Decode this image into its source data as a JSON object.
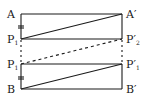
{
  "diagram": {
    "type": "geometry-rectangle-strips",
    "points": {
      "A": {
        "label": "A",
        "sub": "",
        "x": 21,
        "y": 14
      },
      "A_prime": {
        "label": "A",
        "prime": "′",
        "sub": "",
        "x": 122,
        "y": 14
      },
      "P1_upper": {
        "label": "P",
        "sub": "1",
        "x": 21,
        "y": 39
      },
      "P2_prime": {
        "label": "P",
        "prime": "′",
        "sub": "2",
        "x": 122,
        "y": 39
      },
      "P1_lower": {
        "label": "P",
        "sub": "1",
        "x": 21,
        "y": 64
      },
      "P1_prime": {
        "label": "P",
        "prime": "′",
        "sub": "1",
        "x": 122,
        "y": 64
      },
      "B": {
        "label": "B",
        "sub": "",
        "x": 21,
        "y": 89
      },
      "B_prime": {
        "label": "B",
        "prime": "′",
        "sub": "",
        "x": 122,
        "y": 89
      }
    },
    "segments": [
      {
        "from": "A",
        "to": "A_prime",
        "style": "solid"
      },
      {
        "from": "P1_upper",
        "to": "P2_prime",
        "style": "solid"
      },
      {
        "from": "P1_lower",
        "to": "P1_prime",
        "style": "solid"
      },
      {
        "from": "B",
        "to": "B_prime",
        "style": "solid"
      },
      {
        "from": "P1_upper",
        "to": "A_prime",
        "style": "solid"
      },
      {
        "from": "P1_lower",
        "to": "P2_prime",
        "style": "dashed"
      },
      {
        "from": "B",
        "to": "P1_prime",
        "style": "solid"
      }
    ],
    "tick_marks": [
      {
        "position": "AP1",
        "count": 2
      },
      {
        "position": "P1B",
        "count": 2
      }
    ]
  }
}
